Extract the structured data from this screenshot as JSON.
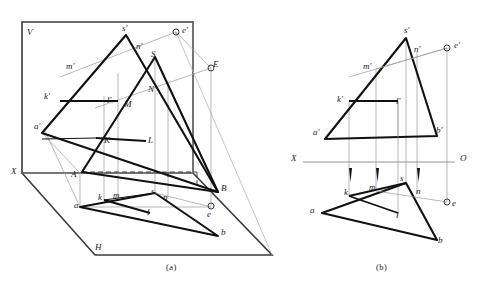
{
  "figure": {
    "title_strip": "",
    "captions": [
      {
        "id": "caption-a",
        "text": "(a)",
        "x": 166,
        "y": 262
      },
      {
        "id": "caption-b",
        "text": "(b)",
        "x": 376,
        "y": 262
      }
    ],
    "colors": {
      "ink": "#1a1a1a",
      "heavy_line": "#111111",
      "thin_line": "#8a8a8a",
      "frame": "#3a3a3a",
      "dashed": "#333333"
    }
  },
  "panel_a": {
    "name": "pictorial-projection-view",
    "plane_labels": [
      {
        "id": "label-V",
        "text": "V",
        "x": 27,
        "y": 28
      },
      {
        "id": "label-H",
        "text": "H",
        "x": 95,
        "y": 243
      },
      {
        "id": "label-X",
        "text": "X",
        "x": 11,
        "y": 167
      }
    ],
    "frontal_points": [
      {
        "id": "label-s-prime",
        "text": "s′",
        "x": 122,
        "y": 24
      },
      {
        "id": "label-n-prime",
        "text": "n′",
        "x": 136,
        "y": 42
      },
      {
        "id": "label-m-prime",
        "text": "m′",
        "x": 66,
        "y": 62
      },
      {
        "id": "label-k-prime",
        "text": "k′",
        "x": 44,
        "y": 92
      },
      {
        "id": "label-l-prime",
        "text": "l′",
        "x": 107,
        "y": 96
      },
      {
        "id": "label-a-prime",
        "text": "a′",
        "x": 34,
        "y": 122
      },
      {
        "id": "label-e-prime",
        "text": "e′",
        "x": 182,
        "y": 26
      }
    ],
    "space_points": [
      {
        "id": "label-S",
        "text": "S",
        "x": 151,
        "y": 50
      },
      {
        "id": "label-N",
        "text": "N",
        "x": 148,
        "y": 85
      },
      {
        "id": "label-M",
        "text": "M",
        "x": 124,
        "y": 100
      },
      {
        "id": "label-K",
        "text": "K",
        "x": 104,
        "y": 136
      },
      {
        "id": "label-L",
        "text": "L",
        "x": 148,
        "y": 136
      },
      {
        "id": "label-A",
        "text": "A",
        "x": 71,
        "y": 170
      },
      {
        "id": "label-B",
        "text": "B",
        "x": 221,
        "y": 184
      },
      {
        "id": "label-E",
        "text": "E",
        "x": 213,
        "y": 60
      }
    ],
    "horizontal_points": [
      {
        "id": "label-a",
        "text": "a",
        "x": 74,
        "y": 201
      },
      {
        "id": "label-k",
        "text": "k",
        "x": 98,
        "y": 193
      },
      {
        "id": "label-m",
        "text": "m",
        "x": 113,
        "y": 191
      },
      {
        "id": "label-s",
        "text": "s",
        "x": 151,
        "y": 187
      },
      {
        "id": "label-n",
        "text": "n",
        "x": 163,
        "y": 193
      },
      {
        "id": "label-l",
        "text": "l",
        "x": 147,
        "y": 208
      },
      {
        "id": "label-b",
        "text": "b",
        "x": 221,
        "y": 228
      },
      {
        "id": "label-e",
        "text": "e",
        "x": 207,
        "y": 210
      }
    ]
  },
  "panel_b": {
    "name": "orthographic-projection-view",
    "axis": [
      {
        "id": "label-X-b",
        "text": "X",
        "x": 291,
        "y": 154
      },
      {
        "id": "label-O-b",
        "text": "O",
        "x": 460,
        "y": 154
      }
    ],
    "frontal_points": [
      {
        "id": "label-s-prime-b",
        "text": "s′",
        "x": 404,
        "y": 26
      },
      {
        "id": "label-n-prime-b",
        "text": "n′",
        "x": 414,
        "y": 45
      },
      {
        "id": "label-m-prime-b",
        "text": "m′",
        "x": 363,
        "y": 62
      },
      {
        "id": "label-k-prime-b",
        "text": "k′",
        "x": 337,
        "y": 95
      },
      {
        "id": "label-l-prime-b",
        "text": "l′",
        "x": 396,
        "y": 97
      },
      {
        "id": "label-a-prime-b",
        "text": "a′",
        "x": 313,
        "y": 128
      },
      {
        "id": "label-b-prime-b",
        "text": "b′",
        "x": 436,
        "y": 126
      },
      {
        "id": "label-e-prime-b",
        "text": "e′",
        "x": 454,
        "y": 41
      }
    ],
    "horizontal_points": [
      {
        "id": "label-a-b",
        "text": "a",
        "x": 310,
        "y": 206
      },
      {
        "id": "label-k-b",
        "text": "k",
        "x": 344,
        "y": 188
      },
      {
        "id": "label-m-b",
        "text": "m",
        "x": 369,
        "y": 183
      },
      {
        "id": "label-s-b",
        "text": "s",
        "x": 400,
        "y": 174
      },
      {
        "id": "label-n-b",
        "text": "n",
        "x": 416,
        "y": 187
      },
      {
        "id": "label-l-b",
        "text": "l",
        "x": 396,
        "y": 211
      },
      {
        "id": "label-b-b",
        "text": "b",
        "x": 438,
        "y": 236
      },
      {
        "id": "label-e-b",
        "text": "e",
        "x": 452,
        "y": 199
      }
    ]
  }
}
